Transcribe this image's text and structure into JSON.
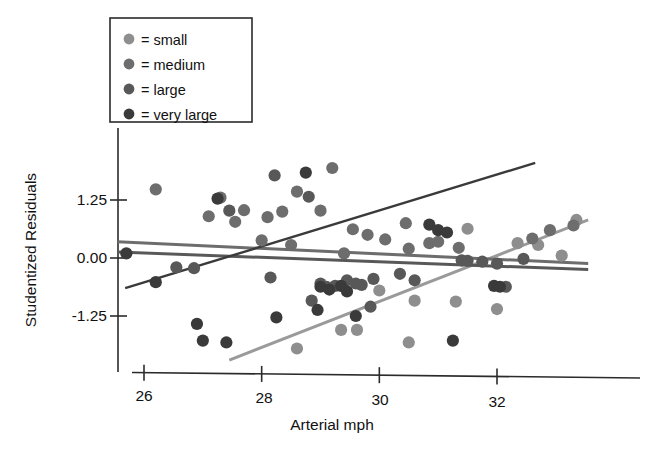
{
  "chart_data": {
    "type": "scatter",
    "title": "",
    "xlabel": "Arterial mph",
    "ylabel": "Studentized Residuals",
    "xlim": [
      25.5,
      33.6
    ],
    "ylim": [
      -2.3,
      2.1
    ],
    "xticks": [
      26,
      28,
      30,
      32
    ],
    "xtick_labels": [
      "26",
      "28",
      "30",
      "32"
    ],
    "yticks": [
      1.25,
      0.0,
      -1.25
    ],
    "ytick_labels": [
      "1.25",
      "0.00",
      "-1.25"
    ],
    "grid": false,
    "legend_position": "top-left",
    "legend_title": "",
    "series": [
      {
        "name": "small",
        "legend_label": "= small",
        "color": "#8e8e8e",
        "marker": "circle",
        "points": [
          [
            29.62,
            -1.55
          ],
          [
            30.0,
            -0.7
          ],
          [
            30.6,
            -0.92
          ],
          [
            31.3,
            -0.94
          ],
          [
            31.5,
            0.63
          ],
          [
            32.0,
            -1.1
          ],
          [
            32.35,
            0.32
          ],
          [
            32.7,
            0.28
          ],
          [
            33.1,
            0.05
          ],
          [
            33.35,
            0.82
          ],
          [
            30.5,
            -1.82
          ],
          [
            28.6,
            -1.95
          ],
          [
            29.35,
            -1.55
          ]
        ]
      },
      {
        "name": "medium",
        "legend_label": "= medium",
        "color": "#6d6d6d",
        "marker": "circle",
        "points": [
          [
            26.2,
            1.48
          ],
          [
            27.1,
            0.9
          ],
          [
            27.3,
            1.3
          ],
          [
            27.55,
            0.78
          ],
          [
            28.0,
            0.38
          ],
          [
            28.1,
            0.88
          ],
          [
            28.35,
            1.0
          ],
          [
            28.6,
            1.43
          ],
          [
            29.0,
            1.02
          ],
          [
            29.2,
            1.94
          ],
          [
            29.55,
            0.62
          ],
          [
            29.8,
            0.5
          ],
          [
            30.1,
            0.4
          ],
          [
            30.45,
            0.75
          ],
          [
            30.5,
            0.2
          ],
          [
            30.85,
            0.32
          ],
          [
            31.0,
            0.35
          ],
          [
            31.35,
            0.22
          ],
          [
            32.6,
            0.42
          ],
          [
            32.9,
            0.6
          ],
          [
            33.3,
            0.7
          ],
          [
            27.7,
            1.03
          ],
          [
            28.5,
            0.28
          ],
          [
            29.4,
            0.1
          ]
        ]
      },
      {
        "name": "large",
        "legend_label": "= large",
        "color": "#585858",
        "marker": "circle",
        "points": [
          [
            26.55,
            -0.2
          ],
          [
            26.85,
            -0.22
          ],
          [
            27.45,
            1.02
          ],
          [
            28.22,
            1.78
          ],
          [
            28.8,
            1.32
          ],
          [
            29.0,
            -0.55
          ],
          [
            29.1,
            -0.62
          ],
          [
            29.25,
            -0.6
          ],
          [
            29.45,
            -0.48
          ],
          [
            29.6,
            -0.55
          ],
          [
            29.7,
            -0.58
          ],
          [
            29.9,
            -0.45
          ],
          [
            30.35,
            -0.34
          ],
          [
            31.4,
            -0.05
          ],
          [
            31.5,
            -0.06
          ],
          [
            31.75,
            -0.08
          ],
          [
            32.0,
            -0.12
          ],
          [
            32.15,
            -0.62
          ],
          [
            32.45,
            -0.02
          ],
          [
            28.85,
            -0.92
          ],
          [
            29.85,
            -1.05
          ],
          [
            28.15,
            -0.42
          ],
          [
            30.6,
            -0.48
          ]
        ]
      },
      {
        "name": "very large",
        "legend_label": "= very large",
        "color": "#3a3a3a",
        "marker": "circle",
        "points": [
          [
            25.7,
            0.1
          ],
          [
            26.2,
            -0.52
          ],
          [
            27.25,
            1.28
          ],
          [
            28.75,
            1.84
          ],
          [
            29.0,
            -0.62
          ],
          [
            29.15,
            -0.68
          ],
          [
            29.35,
            -0.6
          ],
          [
            29.45,
            -0.72
          ],
          [
            28.95,
            -1.12
          ],
          [
            29.6,
            -1.25
          ],
          [
            30.85,
            0.72
          ],
          [
            31.0,
            0.6
          ],
          [
            31.15,
            0.55
          ],
          [
            31.95,
            -0.6
          ],
          [
            32.05,
            -0.62
          ],
          [
            26.9,
            -1.42
          ],
          [
            28.25,
            -1.28
          ],
          [
            27.0,
            -1.78
          ],
          [
            27.4,
            -1.82
          ],
          [
            31.25,
            -1.78
          ]
        ]
      }
    ],
    "regression_lines": [
      {
        "series": "small",
        "color": "#9a9a9a",
        "x_start": 27.45,
        "y_start": -2.2,
        "x_end": 33.55,
        "y_end": 0.82
      },
      {
        "series": "medium",
        "color": "#6d6d6d",
        "x_start": 25.55,
        "y_start": 0.35,
        "x_end": 33.55,
        "y_end": -0.12
      },
      {
        "series": "large",
        "color": "#585858",
        "x_start": 25.55,
        "y_start": 0.13,
        "x_end": 33.55,
        "y_end": -0.25
      },
      {
        "series": "very large",
        "color": "#3a3a3a",
        "x_start": 25.68,
        "y_start": -0.65,
        "x_end": 32.65,
        "y_end": 2.05
      }
    ]
  },
  "legend": {
    "items": [
      {
        "label": "= small",
        "color": "#8e8e8e"
      },
      {
        "label": "= medium",
        "color": "#6d6d6d"
      },
      {
        "label": "= large",
        "color": "#585858"
      },
      {
        "label": "= very large",
        "color": "#3a3a3a"
      }
    ]
  },
  "axes": {
    "x_title": "Arterial mph",
    "y_title": "Studentized Residuals",
    "x_tick_labels": [
      "26",
      "28",
      "30",
      "32"
    ],
    "y_tick_labels": [
      "1.25",
      "0.00",
      "-1.25"
    ]
  }
}
